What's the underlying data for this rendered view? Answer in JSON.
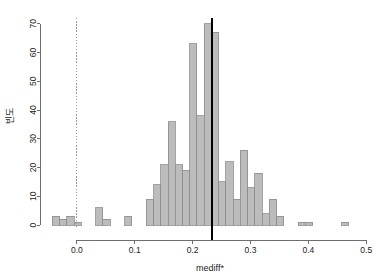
{
  "chart_data": {
    "type": "bar",
    "subtype": "histogram",
    "title": "",
    "xlabel": "mediff*",
    "ylabel": "빈도",
    "xlim": [
      -0.05,
      0.51
    ],
    "ylim": [
      0,
      72
    ],
    "xticks": [
      0.0,
      0.1,
      0.2,
      0.3,
      0.4,
      0.5
    ],
    "xtick_labels": [
      "0.0",
      "0.1",
      "0.2",
      "0.3",
      "0.4",
      "0.5"
    ],
    "yticks": [
      0,
      10,
      20,
      30,
      40,
      50,
      60,
      70
    ],
    "ytick_labels": [
      "0",
      "10",
      "20",
      "30",
      "40",
      "50",
      "60",
      "70"
    ],
    "grid": false,
    "legend": null,
    "bin_width": 0.0125,
    "bar_fill": "#bcbcbc",
    "bar_stroke": "#8c8c8c",
    "bins": [
      {
        "left": -0.0425,
        "right": -0.03,
        "count": 3
      },
      {
        "left": -0.03,
        "right": -0.0175,
        "count": 2
      },
      {
        "left": -0.0175,
        "right": -0.005,
        "count": 3
      },
      {
        "left": -0.005,
        "right": 0.0075,
        "count": 1
      },
      {
        "left": 0.0075,
        "right": 0.02,
        "count": 0
      },
      {
        "left": 0.02,
        "right": 0.0325,
        "count": 0
      },
      {
        "left": 0.0325,
        "right": 0.045,
        "count": 6
      },
      {
        "left": 0.045,
        "right": 0.0575,
        "count": 2
      },
      {
        "left": 0.0575,
        "right": 0.07,
        "count": 0
      },
      {
        "left": 0.07,
        "right": 0.0825,
        "count": 0
      },
      {
        "left": 0.0825,
        "right": 0.095,
        "count": 3
      },
      {
        "left": 0.095,
        "right": 0.1075,
        "count": 0
      },
      {
        "left": 0.1075,
        "right": 0.12,
        "count": 0
      },
      {
        "left": 0.12,
        "right": 0.1325,
        "count": 9
      },
      {
        "left": 0.1325,
        "right": 0.145,
        "count": 14
      },
      {
        "left": 0.145,
        "right": 0.1575,
        "count": 21
      },
      {
        "left": 0.1575,
        "right": 0.17,
        "count": 36
      },
      {
        "left": 0.17,
        "right": 0.1825,
        "count": 21
      },
      {
        "left": 0.1825,
        "right": 0.195,
        "count": 19
      },
      {
        "left": 0.195,
        "right": 0.2075,
        "count": 63
      },
      {
        "left": 0.2075,
        "right": 0.22,
        "count": 38
      },
      {
        "left": 0.22,
        "right": 0.2325,
        "count": 70
      },
      {
        "left": 0.2325,
        "right": 0.245,
        "count": 67
      },
      {
        "left": 0.245,
        "right": 0.2575,
        "count": 15
      },
      {
        "left": 0.2575,
        "right": 0.27,
        "count": 22
      },
      {
        "left": 0.27,
        "right": 0.2825,
        "count": 9
      },
      {
        "left": 0.2825,
        "right": 0.295,
        "count": 26
      },
      {
        "left": 0.295,
        "right": 0.3075,
        "count": 13
      },
      {
        "left": 0.3075,
        "right": 0.32,
        "count": 18
      },
      {
        "left": 0.32,
        "right": 0.3325,
        "count": 4
      },
      {
        "left": 0.3325,
        "right": 0.345,
        "count": 9
      },
      {
        "left": 0.345,
        "right": 0.3575,
        "count": 3
      },
      {
        "left": 0.3575,
        "right": 0.37,
        "count": 0
      },
      {
        "left": 0.37,
        "right": 0.3825,
        "count": 0
      },
      {
        "left": 0.3825,
        "right": 0.395,
        "count": 1
      },
      {
        "left": 0.395,
        "right": 0.4075,
        "count": 1
      },
      {
        "left": 0.4075,
        "right": 0.42,
        "count": 0
      },
      {
        "left": 0.42,
        "right": 0.4325,
        "count": 0
      },
      {
        "left": 0.4325,
        "right": 0.445,
        "count": 0
      },
      {
        "left": 0.445,
        "right": 0.4575,
        "count": 0
      },
      {
        "left": 0.4575,
        "right": 0.47,
        "count": 1
      }
    ],
    "reference_lines": [
      {
        "name": "zero-line",
        "x": 0.0,
        "style": "dotted",
        "color": "#9a9a9a"
      },
      {
        "name": "median-line",
        "x": 0.2335,
        "style": "solid",
        "color": "#000000"
      }
    ]
  }
}
